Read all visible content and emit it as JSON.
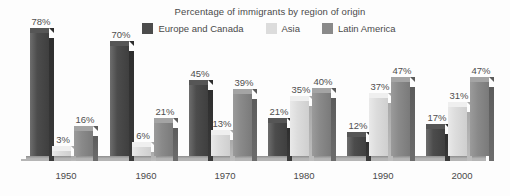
{
  "chart_data": {
    "type": "bar",
    "title": "Percentage of immigrants by region of origin",
    "xlabel": "",
    "ylabel": "",
    "ylim": [
      0,
      80
    ],
    "grid": false,
    "legend_position": "top-center",
    "value_suffix": "%",
    "categories": [
      "1950",
      "1960",
      "1970",
      "1980",
      "1990",
      "2000"
    ],
    "series": [
      {
        "name": "Europe and Canada",
        "color": "#4c4c4c",
        "values": [
          78,
          70,
          45,
          21,
          12,
          17
        ],
        "labels": [
          "78%",
          "70%",
          "45%",
          "21%",
          "12%",
          "17%"
        ]
      },
      {
        "name": "Asia",
        "color": "#dcdcdc",
        "values": [
          3,
          6,
          13,
          35,
          37,
          31
        ],
        "labels": [
          "3%",
          "6%",
          "13%",
          "35%",
          "37%",
          "31%"
        ]
      },
      {
        "name": "Latin America",
        "color": "#8a8a8a",
        "values": [
          16,
          21,
          39,
          40,
          47,
          47
        ],
        "labels": [
          "16%",
          "21%",
          "39%",
          "40%",
          "47%",
          "47%"
        ]
      }
    ]
  },
  "legend": {
    "items": [
      {
        "label": "Europe and Canada",
        "swatch": "#4c4c4c"
      },
      {
        "label": "Asia",
        "swatch": "#dcdcdc"
      },
      {
        "label": "Latin America",
        "swatch": "#8a8a8a"
      }
    ]
  },
  "axis": {
    "categories": [
      "1950",
      "1960",
      "1970",
      "1980",
      "1990",
      "2000"
    ]
  }
}
